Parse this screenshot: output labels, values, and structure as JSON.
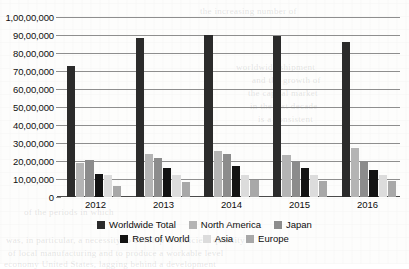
{
  "chart_data": {
    "type": "bar",
    "title": "",
    "subtitle": "",
    "xlabel": "",
    "ylabel": "",
    "categories": [
      "2012",
      "2013",
      "2014",
      "2015",
      "2016"
    ],
    "ylim": [
      0,
      10000000
    ],
    "ytick_values": [
      0,
      1000000,
      2000000,
      3000000,
      4000000,
      5000000,
      6000000,
      7000000,
      8000000,
      9000000,
      10000000
    ],
    "ytick_labels": [
      "0",
      "10,00,000",
      "20,00,000",
      "30,00,000",
      "40,00,000",
      "50,00,000",
      "60,00,000",
      "70,00,000",
      "80,00,000",
      "90,00,000",
      "1,00,00,000"
    ],
    "grid": true,
    "grid_axis": "y",
    "legend_position": "bottom",
    "number_format": "indian",
    "series": [
      {
        "name": "Worldwide Total",
        "color": "#2b2b2b",
        "values": [
          7300000,
          8850000,
          9000000,
          8950000,
          8600000
        ]
      },
      {
        "name": "North America",
        "color": "#b4b4b4",
        "values": [
          1900000,
          2400000,
          2550000,
          2350000,
          2750000
        ]
      },
      {
        "name": "Japan",
        "color": "#8c8c8c",
        "values": [
          2050000,
          2150000,
          2400000,
          2000000,
          2000000
        ]
      },
      {
        "name": "Rest of World",
        "color": "#131313",
        "values": [
          1300000,
          1600000,
          1750000,
          1600000,
          1500000
        ]
      },
      {
        "name": "Asia",
        "color": "#dcdcdc",
        "values": [
          1200000,
          1200000,
          1250000,
          1200000,
          1200000
        ]
      },
      {
        "name": "Europe",
        "color": "#a8a8a8",
        "values": [
          600000,
          850000,
          950000,
          900000,
          900000
        ]
      }
    ]
  },
  "legend": {
    "rows": [
      [
        {
          "label": "Worldwide Total",
          "color": "#2b2b2b"
        },
        {
          "label": "North America",
          "color": "#b4b4b4"
        },
        {
          "label": "Japan",
          "color": "#8c8c8c"
        }
      ],
      [
        {
          "label": "Rest of World",
          "color": "#131313"
        },
        {
          "label": "Asia",
          "color": "#dcdcdc"
        },
        {
          "label": "Europe",
          "color": "#a8a8a8"
        }
      ]
    ]
  },
  "background_artifacts": {
    "note": "faint scanned-page bleed-through behind the chart",
    "ghosts": [
      {
        "text": "the increasing number of",
        "x": 200,
        "y": 6
      },
      {
        "text": "worldwide shipment",
        "x": 236,
        "y": 62
      },
      {
        "text": "and the growth of",
        "x": 252,
        "y": 75
      },
      {
        "text": "the capital market",
        "x": 248,
        "y": 88
      },
      {
        "text": "in the last decade",
        "x": 250,
        "y": 101
      },
      {
        "text": "is a consistent",
        "x": 258,
        "y": 114
      },
      {
        "text": "of the periods in which",
        "x": 24,
        "y": 207
      },
      {
        "text": "was, in particular, a necessity to develop a sufficient quantity",
        "x": 6,
        "y": 235
      },
      {
        "text": "of local manufacturing and to produce a workable level",
        "x": 8,
        "y": 248
      },
      {
        "text": "economy United States, lagging behind a development",
        "x": 4,
        "y": 259
      }
    ]
  }
}
